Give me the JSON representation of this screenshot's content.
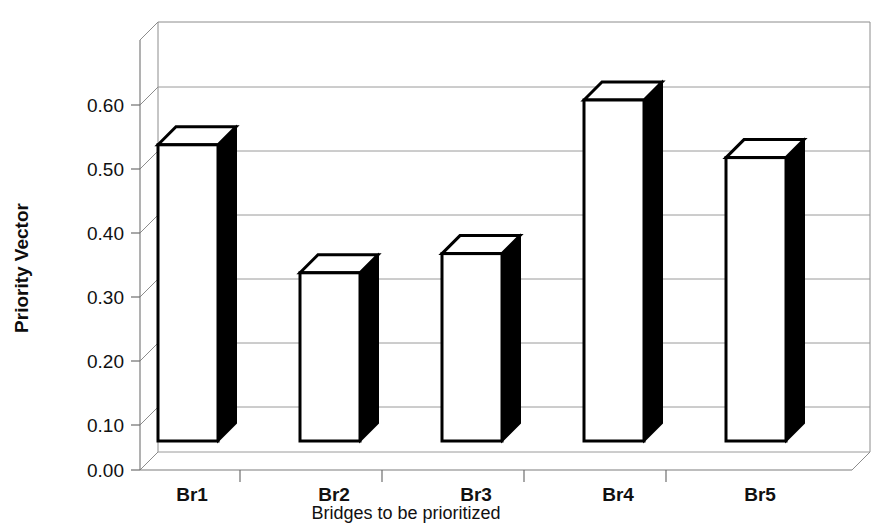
{
  "chart_data": {
    "type": "bar",
    "title": "",
    "subtitle": "",
    "xlabel": "Bridges to be prioritized",
    "ylabel": "Priority Vector",
    "categories": [
      "Br1",
      "Br2",
      "Br3",
      "Br4",
      "Br5"
    ],
    "values": [
      0.48,
      0.28,
      0.31,
      0.55,
      0.46
    ],
    "series": [
      {
        "name": "Priority Vector",
        "values": [
          0.48,
          0.28,
          0.31,
          0.55,
          0.46
        ]
      }
    ],
    "ylim": [
      0.0,
      0.6
    ],
    "ytick_labels": [
      "0.00",
      "0.10",
      "0.20",
      "0.30",
      "0.40",
      "0.50",
      "0.60"
    ],
    "ytick_values": [
      0.0,
      0.1,
      0.2,
      0.3,
      0.4,
      0.5,
      0.6
    ],
    "grid": true,
    "legend": "none",
    "style": "3d-column",
    "colors": {
      "bar_face": "#ffffff",
      "bar_side": "#000000",
      "bar_outline": "#000000",
      "gridline": "#9a9a9a",
      "background": "#ffffff",
      "text": "#111111"
    }
  }
}
